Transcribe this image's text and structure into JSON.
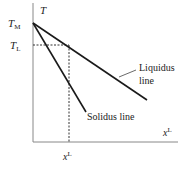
{
  "diagram": {
    "axes": {
      "y_label": "T",
      "x_label_right": "x",
      "x_label_right_sup": "L",
      "x_label_bottom": "x",
      "x_label_bottom_sup": "L"
    },
    "ticks": {
      "t_melt": "T",
      "t_melt_sub": "M",
      "t_liquidus": "T",
      "t_liquidus_sub": "L"
    },
    "curves": [
      {
        "name": "Liquidus",
        "label_line1": "Liquidus",
        "label_line2": "line"
      },
      {
        "name": "Solidus",
        "label": "Solidus line"
      }
    ],
    "colors": {
      "axis": "#777777",
      "line": "#1a1a1a",
      "text": "#222222"
    }
  }
}
